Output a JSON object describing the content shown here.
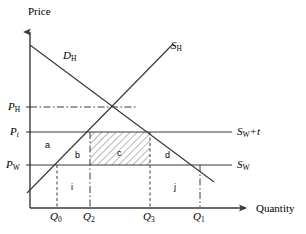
{
  "figure": {
    "type": "economics-supply-demand-diagram",
    "axes": {
      "y_label": "Price",
      "x_label": "Quantity",
      "y_axis_x": 30,
      "x_axis_y": 208,
      "y_axis_top": 27,
      "x_axis_right": 250
    },
    "price_ticks": [
      {
        "id": "p_h",
        "base": "P",
        "sub": "H",
        "y": 107,
        "label_x": 8,
        "style": "dash-dot"
      },
      {
        "id": "p_t",
        "base": "P",
        "sub": "t",
        "sub_italic": true,
        "y": 132,
        "label_x": 8,
        "style": "solid"
      },
      {
        "id": "p_w",
        "base": "P",
        "sub": "W",
        "y": 165,
        "label_x": 6,
        "style": "solid"
      }
    ],
    "quantity_ticks": [
      {
        "id": "q_0",
        "base": "Q",
        "sub": "0",
        "x": 57,
        "label_y": 212,
        "drop_from_y": 165,
        "style": "dashed"
      },
      {
        "id": "q_2",
        "base": "Q",
        "sub": "2",
        "x": 90,
        "label_y": 212,
        "drop_from_y": 132,
        "style": "dash-dot"
      },
      {
        "id": "q_3",
        "base": "Q",
        "sub": "3",
        "x": 150,
        "label_y": 212,
        "drop_from_y": 132,
        "style": "dashed"
      },
      {
        "id": "q_1",
        "base": "Q",
        "sub": "1",
        "x": 200,
        "label_y": 212,
        "drop_from_y": 165,
        "style": "dash-dot"
      }
    ],
    "curves": [
      {
        "id": "demand_home",
        "base": "D",
        "sub": "H",
        "label_x": 63,
        "label_y": 52,
        "x1": 30,
        "y1": 45,
        "x2": 214,
        "y2": 182
      },
      {
        "id": "supply_home",
        "base": "S",
        "sub": "H",
        "label_x": 172,
        "label_y": 42,
        "x1": 27,
        "y1": 193,
        "x2": 173,
        "y2": 44
      }
    ],
    "world_price_lines": [
      {
        "id": "s_w_plus_t",
        "base": "S",
        "sub": "W",
        "suffix": "+t",
        "y": 132,
        "x1": 30,
        "x2": 232,
        "label_x": 237,
        "label_y": 127
      },
      {
        "id": "s_w",
        "base": "S",
        "sub": "W",
        "suffix": "",
        "y": 165,
        "x1": 30,
        "x2": 232,
        "label_x": 237,
        "label_y": 160
      }
    ],
    "regions": [
      {
        "id": "region-a",
        "label": "a",
        "x": 46,
        "y": 141
      },
      {
        "id": "region-b",
        "label": "b",
        "x": 76,
        "y": 151
      },
      {
        "id": "region-c",
        "label": "c",
        "x": 118,
        "y": 149
      },
      {
        "id": "region-d",
        "label": "d",
        "x": 166,
        "y": 151
      },
      {
        "id": "region-i",
        "label": "i",
        "x": 71,
        "y": 184
      },
      {
        "id": "region-j",
        "label": "j",
        "x": 174,
        "y": 184
      }
    ],
    "hatched_area": {
      "id": "region-c-fill",
      "x": 90,
      "y": 132,
      "width": 60,
      "height": 33,
      "pattern": "diagonal-hatch"
    },
    "colors": {
      "line": "#3a3a3a",
      "text": "#000000",
      "hatch": "#666666",
      "background": "#ffffff"
    }
  }
}
